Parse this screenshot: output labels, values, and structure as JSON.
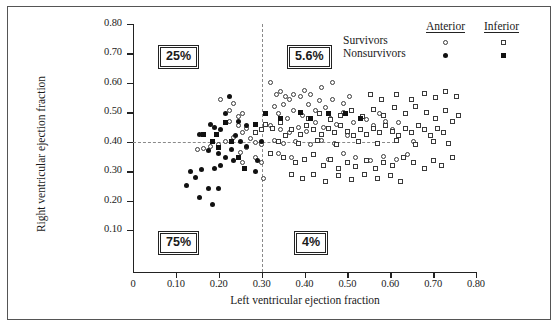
{
  "axes": {
    "x_title": "Left ventricular ejection fraction",
    "y_title": "Right ventricular ejection fraction",
    "x_ticks": [
      "0",
      "0.10",
      "0.20",
      "0.30",
      "0.40",
      "0.50",
      "0.60",
      "0.70",
      "0.80"
    ],
    "y_ticks": [
      "0.80",
      "0.70",
      "0.60",
      "0.50",
      "0.40",
      "0.30",
      "0.20",
      "0.10"
    ]
  },
  "legend": {
    "col1": "Anterior",
    "col2": "Inferior",
    "row1": "Survivors",
    "row2": "Nonsurvivors",
    "marker_anterior_survivor": "open-circle",
    "marker_inferior_survivor": "open-square",
    "marker_anterior_nonsurvivor": "filled-circle",
    "marker_inferior_nonsurvivor": "filled-square"
  },
  "quadrant_labels": {
    "upper_left": "25%",
    "upper_right": "5.6%",
    "lower_left": "75%",
    "lower_right": "4%"
  },
  "reference_lines": {
    "vertical_x": 0.3,
    "horizontal_y": 0.4
  },
  "chart_data": {
    "type": "scatter",
    "title": "",
    "xlabel": "Left ventricular ejection fraction",
    "ylabel": "Right ventricular ejection fraction",
    "xlim": [
      0,
      0.85
    ],
    "ylim": [
      0.05,
      0.82
    ],
    "grid": false,
    "legend_position": "top-right",
    "reference_lines": {
      "vertical_x": 0.3,
      "horizontal_y": 0.4
    },
    "annotations": [
      {
        "text": "25%",
        "quadrant": "upper-left",
        "x": 0.14,
        "y": 0.705
      },
      {
        "text": "5.6%",
        "quadrant": "upper-right",
        "x": 0.39,
        "y": 0.705
      },
      {
        "text": "75%",
        "quadrant": "lower-left",
        "x": 0.14,
        "y": 0.105
      },
      {
        "text": "4%",
        "quadrant": "lower-right",
        "x": 0.4,
        "y": 0.105
      }
    ],
    "series": [
      {
        "name": "Anterior Survivors",
        "marker": "open-circle",
        "points": [
          [
            0.205,
            0.545
          ],
          [
            0.225,
            0.505
          ],
          [
            0.235,
            0.53
          ],
          [
            0.245,
            0.485
          ],
          [
            0.255,
            0.495
          ],
          [
            0.225,
            0.47
          ],
          [
            0.245,
            0.455
          ],
          [
            0.265,
            0.445
          ],
          [
            0.255,
            0.43
          ],
          [
            0.235,
            0.415
          ],
          [
            0.215,
            0.4
          ],
          [
            0.2,
            0.392
          ],
          [
            0.18,
            0.385
          ],
          [
            0.165,
            0.378
          ],
          [
            0.15,
            0.372
          ],
          [
            0.275,
            0.41
          ],
          [
            0.285,
            0.398
          ],
          [
            0.265,
            0.38
          ],
          [
            0.25,
            0.365
          ],
          [
            0.285,
            0.345
          ],
          [
            0.3,
            0.392
          ],
          [
            0.3,
            0.33
          ],
          [
            0.305,
            0.275
          ],
          [
            0.255,
            0.33
          ],
          [
            0.32,
            0.6
          ],
          [
            0.335,
            0.56
          ],
          [
            0.345,
            0.57
          ],
          [
            0.355,
            0.555
          ],
          [
            0.35,
            0.525
          ],
          [
            0.365,
            0.545
          ],
          [
            0.375,
            0.56
          ],
          [
            0.39,
            0.555
          ],
          [
            0.4,
            0.575
          ],
          [
            0.415,
            0.56
          ],
          [
            0.33,
            0.52
          ],
          [
            0.34,
            0.495
          ],
          [
            0.36,
            0.48
          ],
          [
            0.375,
            0.505
          ],
          [
            0.395,
            0.49
          ],
          [
            0.41,
            0.525
          ],
          [
            0.425,
            0.505
          ],
          [
            0.435,
            0.54
          ],
          [
            0.45,
            0.515
          ],
          [
            0.465,
            0.545
          ],
          [
            0.32,
            0.455
          ],
          [
            0.345,
            0.44
          ],
          [
            0.365,
            0.43
          ],
          [
            0.385,
            0.45
          ],
          [
            0.405,
            0.435
          ],
          [
            0.425,
            0.465
          ],
          [
            0.445,
            0.45
          ],
          [
            0.46,
            0.48
          ],
          [
            0.475,
            0.46
          ],
          [
            0.49,
            0.5
          ],
          [
            0.33,
            0.405
          ],
          [
            0.35,
            0.395
          ],
          [
            0.38,
            0.4
          ],
          [
            0.415,
            0.39
          ],
          [
            0.44,
            0.405
          ],
          [
            0.47,
            0.395
          ],
          [
            0.5,
            0.42
          ],
          [
            0.515,
            0.465
          ],
          [
            0.53,
            0.44
          ],
          [
            0.545,
            0.475
          ],
          [
            0.56,
            0.455
          ],
          [
            0.575,
            0.495
          ],
          [
            0.59,
            0.47
          ],
          [
            0.605,
            0.44
          ],
          [
            0.62,
            0.465
          ],
          [
            0.34,
            0.36
          ],
          [
            0.37,
            0.345
          ],
          [
            0.42,
            0.355
          ],
          [
            0.455,
            0.34
          ],
          [
            0.49,
            0.36
          ],
          [
            0.52,
            0.345
          ],
          [
            0.555,
            0.335
          ],
          [
            0.585,
            0.35
          ],
          [
            0.615,
            0.34
          ],
          [
            0.64,
            0.355
          ],
          [
            0.655,
            0.4
          ],
          [
            0.49,
            0.53
          ],
          [
            0.505,
            0.555
          ],
          [
            0.44,
            0.585
          ],
          [
            0.465,
            0.6
          ]
        ]
      },
      {
        "name": "Anterior Nonsurvivors",
        "marker": "filled-circle",
        "points": [
          [
            0.225,
            0.555
          ],
          [
            0.19,
            0.45
          ],
          [
            0.18,
            0.46
          ],
          [
            0.155,
            0.425
          ],
          [
            0.205,
            0.44
          ],
          [
            0.215,
            0.495
          ],
          [
            0.24,
            0.42
          ],
          [
            0.25,
            0.4
          ],
          [
            0.265,
            0.385
          ],
          [
            0.23,
            0.375
          ],
          [
            0.175,
            0.37
          ],
          [
            0.2,
            0.36
          ],
          [
            0.215,
            0.345
          ],
          [
            0.235,
            0.335
          ],
          [
            0.205,
            0.32
          ],
          [
            0.19,
            0.31
          ],
          [
            0.16,
            0.305
          ],
          [
            0.145,
            0.28
          ],
          [
            0.175,
            0.24
          ],
          [
            0.2,
            0.24
          ],
          [
            0.185,
            0.185
          ],
          [
            0.155,
            0.21
          ],
          [
            0.125,
            0.25
          ],
          [
            0.135,
            0.3
          ],
          [
            0.3,
            0.4
          ],
          [
            0.29,
            0.335
          ],
          [
            0.285,
            0.3
          ],
          [
            0.265,
            0.455
          ],
          [
            0.245,
            0.47
          ]
        ]
      },
      {
        "name": "Inferior Survivors",
        "marker": "open-square",
        "points": [
          [
            0.31,
            0.46
          ],
          [
            0.325,
            0.445
          ],
          [
            0.345,
            0.465
          ],
          [
            0.3,
            0.44
          ],
          [
            0.285,
            0.43
          ],
          [
            0.355,
            0.42
          ],
          [
            0.37,
            0.44
          ],
          [
            0.39,
            0.425
          ],
          [
            0.405,
            0.455
          ],
          [
            0.42,
            0.44
          ],
          [
            0.44,
            0.425
          ],
          [
            0.455,
            0.445
          ],
          [
            0.47,
            0.43
          ],
          [
            0.485,
            0.455
          ],
          [
            0.5,
            0.435
          ],
          [
            0.515,
            0.42
          ],
          [
            0.53,
            0.44
          ],
          [
            0.545,
            0.425
          ],
          [
            0.56,
            0.445
          ],
          [
            0.575,
            0.43
          ],
          [
            0.59,
            0.455
          ],
          [
            0.605,
            0.435
          ],
          [
            0.62,
            0.42
          ],
          [
            0.635,
            0.445
          ],
          [
            0.65,
            0.43
          ],
          [
            0.665,
            0.455
          ],
          [
            0.68,
            0.44
          ],
          [
            0.695,
            0.42
          ],
          [
            0.71,
            0.445
          ],
          [
            0.725,
            0.43
          ],
          [
            0.34,
            0.4
          ],
          [
            0.385,
            0.395
          ],
          [
            0.43,
            0.405
          ],
          [
            0.475,
            0.39
          ],
          [
            0.525,
            0.4
          ],
          [
            0.57,
            0.395
          ],
          [
            0.615,
            0.405
          ],
          [
            0.66,
            0.39
          ],
          [
            0.7,
            0.4
          ],
          [
            0.735,
            0.395
          ],
          [
            0.32,
            0.36
          ],
          [
            0.35,
            0.345
          ],
          [
            0.38,
            0.33
          ],
          [
            0.4,
            0.34
          ],
          [
            0.42,
            0.355
          ],
          [
            0.445,
            0.32
          ],
          [
            0.46,
            0.34
          ],
          [
            0.48,
            0.31
          ],
          [
            0.5,
            0.33
          ],
          [
            0.52,
            0.315
          ],
          [
            0.545,
            0.335
          ],
          [
            0.565,
            0.31
          ],
          [
            0.585,
            0.33
          ],
          [
            0.605,
            0.32
          ],
          [
            0.63,
            0.345
          ],
          [
            0.655,
            0.33
          ],
          [
            0.68,
            0.31
          ],
          [
            0.7,
            0.335
          ],
          [
            0.72,
            0.32
          ],
          [
            0.745,
            0.345
          ],
          [
            0.37,
            0.29
          ],
          [
            0.395,
            0.275
          ],
          [
            0.42,
            0.29
          ],
          [
            0.45,
            0.265
          ],
          [
            0.48,
            0.285
          ],
          [
            0.51,
            0.27
          ],
          [
            0.54,
            0.29
          ],
          [
            0.57,
            0.275
          ],
          [
            0.6,
            0.285
          ],
          [
            0.625,
            0.265
          ],
          [
            0.39,
            0.5
          ],
          [
            0.41,
            0.48
          ],
          [
            0.435,
            0.495
          ],
          [
            0.46,
            0.475
          ],
          [
            0.485,
            0.49
          ],
          [
            0.51,
            0.505
          ],
          [
            0.535,
            0.485
          ],
          [
            0.56,
            0.51
          ],
          [
            0.585,
            0.49
          ],
          [
            0.61,
            0.515
          ],
          [
            0.635,
            0.495
          ],
          [
            0.66,
            0.52
          ],
          [
            0.685,
            0.5
          ],
          [
            0.705,
            0.48
          ],
          [
            0.73,
            0.505
          ],
          [
            0.555,
            0.56
          ],
          [
            0.58,
            0.545
          ],
          [
            0.615,
            0.56
          ],
          [
            0.65,
            0.545
          ],
          [
            0.68,
            0.565
          ],
          [
            0.705,
            0.55
          ],
          [
            0.73,
            0.57
          ],
          [
            0.755,
            0.555
          ],
          [
            0.745,
            0.47
          ],
          [
            0.76,
            0.49
          ]
        ]
      },
      {
        "name": "Inferior Nonsurvivors",
        "marker": "filled-square",
        "points": [
          [
            0.215,
            0.465
          ],
          [
            0.2,
            0.38
          ],
          [
            0.185,
            0.4
          ],
          [
            0.245,
            0.345
          ],
          [
            0.285,
            0.46
          ],
          [
            0.31,
            0.495
          ],
          [
            0.345,
            0.48
          ],
          [
            0.39,
            0.5
          ],
          [
            0.415,
            0.48
          ],
          [
            0.455,
            0.495
          ],
          [
            0.495,
            0.495
          ],
          [
            0.53,
            0.48
          ],
          [
            0.165,
            0.425
          ],
          [
            0.195,
            0.425
          ],
          [
            0.23,
            0.4
          ],
          [
            0.26,
            0.31
          ]
        ]
      }
    ]
  }
}
